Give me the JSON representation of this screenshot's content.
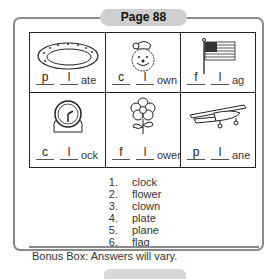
{
  "header": {
    "title": "Page 88"
  },
  "grid": {
    "cells": [
      {
        "picture": "plate-icon",
        "blank1": "p",
        "blank2": "l",
        "suffix": "ate"
      },
      {
        "picture": "clown-icon",
        "blank1": "c",
        "blank2": "l",
        "suffix": "own"
      },
      {
        "picture": "flag-icon",
        "blank1": "f",
        "blank2": "l",
        "suffix": "ag"
      },
      {
        "picture": "clock-icon",
        "blank1": "c",
        "blank2": "l",
        "suffix": "ock"
      },
      {
        "picture": "flower-icon",
        "blank1": "f",
        "blank2": "l",
        "suffix": "ower"
      },
      {
        "picture": "plane-icon",
        "blank1": "p",
        "blank2": "l",
        "suffix": "ane"
      }
    ]
  },
  "answers": [
    {
      "num": "1.",
      "word": "clock"
    },
    {
      "num": "2.",
      "word": "flower"
    },
    {
      "num": "3.",
      "word": "clown"
    },
    {
      "num": "4.",
      "word": "plate"
    },
    {
      "num": "5.",
      "word": "plane"
    },
    {
      "num": "6.",
      "word": "flag"
    }
  ],
  "bonus": {
    "text": "Bonus Box:  Answers will vary."
  },
  "colors": {
    "frame": "#8a8a8a",
    "tab": "#cfcfcf",
    "ink": "#222222"
  }
}
